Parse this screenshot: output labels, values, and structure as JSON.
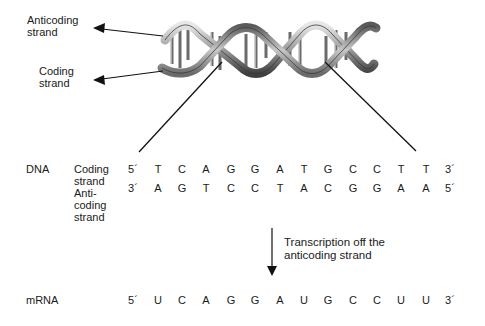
{
  "helix_labels": {
    "anticoding": [
      "Anticoding",
      "strand"
    ],
    "coding": [
      "Coding",
      "strand"
    ]
  },
  "dna": {
    "label": "DNA",
    "coding_strand": {
      "label": [
        "Coding",
        "strand"
      ],
      "start_end": "5´",
      "end_end": "3´",
      "bases": [
        "T",
        "C",
        "A",
        "G",
        "G",
        "A",
        "T",
        "G",
        "C",
        "C",
        "T",
        "T"
      ]
    },
    "anticoding_strand": {
      "label": [
        "Anti-",
        "coding",
        "strand"
      ],
      "start_end": "3´",
      "end_end": "5´",
      "bases": [
        "A",
        "G",
        "T",
        "C",
        "C",
        "T",
        "A",
        "C",
        "G",
        "G",
        "A",
        "A"
      ]
    }
  },
  "transcription": {
    "label": [
      "Transcription off the",
      "anticoding strand"
    ]
  },
  "mrna": {
    "label": "mRNA",
    "start_end": "5´",
    "end_end": "3´",
    "bases": [
      "U",
      "C",
      "A",
      "G",
      "G",
      "A",
      "U",
      "G",
      "C",
      "C",
      "U",
      "U"
    ]
  },
  "colors": {
    "text": "#1a1a1a",
    "line": "#111111",
    "helix_light": "#d9d9d9",
    "helix_mid": "#9a9a9a",
    "helix_dark": "#4a4a4a"
  }
}
